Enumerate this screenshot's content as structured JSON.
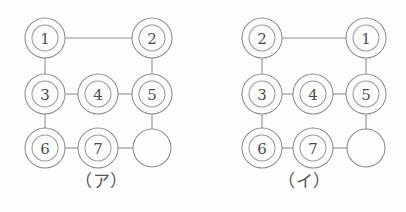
{
  "page": {
    "background_color": "#fdfdfd",
    "line_color": "#8d8d8d",
    "label_color": "#4e4e4e",
    "width": 406,
    "height": 212
  },
  "figures": [
    {
      "id": "figure-a",
      "caption": "（ア）",
      "caption_label": "ア",
      "nodes": [
        {
          "id": "n-tl",
          "label": "1",
          "type": "token",
          "col": 0,
          "row": 0,
          "cx": 45,
          "cy": 38,
          "r_outer": 20,
          "r_inner": 13
        },
        {
          "id": "n-tr",
          "label": "2",
          "type": "token",
          "col": 2,
          "row": 0,
          "cx": 152,
          "cy": 38,
          "r_outer": 20,
          "r_inner": 13
        },
        {
          "id": "n-ml",
          "label": "3",
          "type": "token",
          "col": 0,
          "row": 1,
          "cx": 45,
          "cy": 94,
          "r_outer": 20,
          "r_inner": 13
        },
        {
          "id": "n-mc",
          "label": "4",
          "type": "token",
          "col": 1,
          "row": 1,
          "cx": 98,
          "cy": 94,
          "r_outer": 20,
          "r_inner": 13
        },
        {
          "id": "n-mr",
          "label": "5",
          "type": "token",
          "col": 2,
          "row": 1,
          "cx": 152,
          "cy": 94,
          "r_outer": 20,
          "r_inner": 13
        },
        {
          "id": "n-bl",
          "label": "6",
          "type": "token",
          "col": 0,
          "row": 2,
          "cx": 45,
          "cy": 148,
          "r_outer": 20,
          "r_inner": 13
        },
        {
          "id": "n-bc",
          "label": "7",
          "type": "token",
          "col": 1,
          "row": 2,
          "cx": 98,
          "cy": 148,
          "r_outer": 20,
          "r_inner": 13
        },
        {
          "id": "n-br",
          "label": "",
          "type": "empty",
          "col": 2,
          "row": 2,
          "cx": 152,
          "cy": 148,
          "r_outer": 19,
          "r_inner": 0
        }
      ],
      "edges": [
        {
          "id": "e-a-1",
          "from": "n-tl",
          "to": "n-tr",
          "x1": 65,
          "y1": 38,
          "x2": 132,
          "y2": 38
        },
        {
          "id": "e-a-2",
          "from": "n-tl",
          "to": "n-ml",
          "x1": 45,
          "y1": 58,
          "x2": 45,
          "y2": 74
        },
        {
          "id": "e-a-3",
          "from": "n-tr",
          "to": "n-mr",
          "x1": 152,
          "y1": 58,
          "x2": 152,
          "y2": 74
        },
        {
          "id": "e-a-4",
          "from": "n-ml",
          "to": "n-mc",
          "x1": 65,
          "y1": 94,
          "x2": 78,
          "y2": 94
        },
        {
          "id": "e-a-5",
          "from": "n-mc",
          "to": "n-mr",
          "x1": 118,
          "y1": 94,
          "x2": 132,
          "y2": 94
        },
        {
          "id": "e-a-6",
          "from": "n-ml",
          "to": "n-bl",
          "x1": 45,
          "y1": 114,
          "x2": 45,
          "y2": 128
        },
        {
          "id": "e-a-7",
          "from": "n-mr",
          "to": "n-br",
          "x1": 152,
          "y1": 114,
          "x2": 152,
          "y2": 129
        },
        {
          "id": "e-a-8",
          "from": "n-bl",
          "to": "n-bc",
          "x1": 65,
          "y1": 148,
          "x2": 78,
          "y2": 148
        },
        {
          "id": "e-a-9",
          "from": "n-bc",
          "to": "n-br",
          "x1": 118,
          "y1": 148,
          "x2": 133,
          "y2": 148
        }
      ]
    },
    {
      "id": "figure-b",
      "caption": "（イ）",
      "caption_label": "イ",
      "nodes": [
        {
          "id": "n-tl",
          "label": "2",
          "type": "token",
          "col": 0,
          "row": 0,
          "cx": 59,
          "cy": 38,
          "r_outer": 20,
          "r_inner": 13
        },
        {
          "id": "n-tr",
          "label": "1",
          "type": "token",
          "col": 2,
          "row": 0,
          "cx": 163,
          "cy": 38,
          "r_outer": 20,
          "r_inner": 13
        },
        {
          "id": "n-ml",
          "label": "3",
          "type": "token",
          "col": 0,
          "row": 1,
          "cx": 59,
          "cy": 94,
          "r_outer": 20,
          "r_inner": 13
        },
        {
          "id": "n-mc",
          "label": "4",
          "type": "token",
          "col": 1,
          "row": 1,
          "cx": 110,
          "cy": 94,
          "r_outer": 20,
          "r_inner": 13
        },
        {
          "id": "n-mr",
          "label": "5",
          "type": "token",
          "col": 2,
          "row": 1,
          "cx": 163,
          "cy": 94,
          "r_outer": 20,
          "r_inner": 13
        },
        {
          "id": "n-bl",
          "label": "6",
          "type": "token",
          "col": 0,
          "row": 2,
          "cx": 59,
          "cy": 148,
          "r_outer": 20,
          "r_inner": 13
        },
        {
          "id": "n-bc",
          "label": "7",
          "type": "token",
          "col": 1,
          "row": 2,
          "cx": 110,
          "cy": 148,
          "r_outer": 20,
          "r_inner": 13
        },
        {
          "id": "n-br",
          "label": "",
          "type": "empty",
          "col": 2,
          "row": 2,
          "cx": 163,
          "cy": 148,
          "r_outer": 19,
          "r_inner": 0
        }
      ],
      "edges": [
        {
          "id": "e-b-1",
          "from": "n-tl",
          "to": "n-tr",
          "x1": 79,
          "y1": 38,
          "x2": 143,
          "y2": 38
        },
        {
          "id": "e-b-2",
          "from": "n-tl",
          "to": "n-ml",
          "x1": 59,
          "y1": 58,
          "x2": 59,
          "y2": 74
        },
        {
          "id": "e-b-3",
          "from": "n-tr",
          "to": "n-mr",
          "x1": 163,
          "y1": 58,
          "x2": 163,
          "y2": 74
        },
        {
          "id": "e-b-4",
          "from": "n-ml",
          "to": "n-mc",
          "x1": 79,
          "y1": 94,
          "x2": 90,
          "y2": 94
        },
        {
          "id": "e-b-5",
          "from": "n-mc",
          "to": "n-mr",
          "x1": 130,
          "y1": 94,
          "x2": 143,
          "y2": 94
        },
        {
          "id": "e-b-6",
          "from": "n-ml",
          "to": "n-bl",
          "x1": 59,
          "y1": 114,
          "x2": 59,
          "y2": 128
        },
        {
          "id": "e-b-7",
          "from": "n-mr",
          "to": "n-br",
          "x1": 163,
          "y1": 114,
          "x2": 163,
          "y2": 129
        },
        {
          "id": "e-b-8",
          "from": "n-bl",
          "to": "n-bc",
          "x1": 79,
          "y1": 148,
          "x2": 90,
          "y2": 148
        },
        {
          "id": "e-b-9",
          "from": "n-bc",
          "to": "n-br",
          "x1": 130,
          "y1": 148,
          "x2": 144,
          "y2": 148
        }
      ]
    }
  ]
}
